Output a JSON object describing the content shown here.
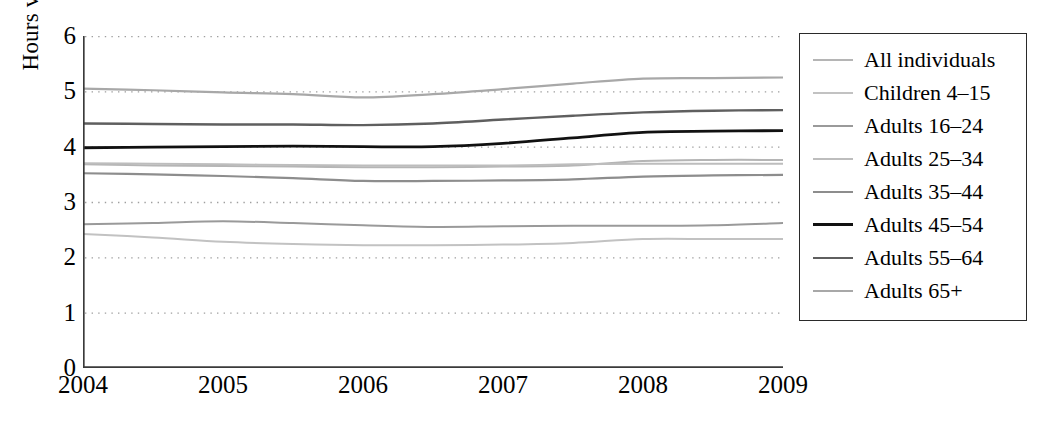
{
  "chart_data": {
    "type": "line",
    "title": "",
    "xlabel": "",
    "ylabel": "Hours viewed",
    "xlim": [
      2004,
      2009
    ],
    "ylim": [
      0,
      6
    ],
    "yticks": [
      6,
      5,
      4,
      3,
      2,
      1,
      0
    ],
    "xticks": [
      "2004",
      "2005",
      "2006",
      "2007",
      "2008",
      "2009"
    ],
    "grid": "horizontal dotted gridlines at each integer from 1 to 6",
    "legend_position": "right, outside plot, bordered box",
    "x": [
      2004,
      2004.5,
      2005,
      2005.5,
      2006,
      2006.5,
      2007,
      2007.5,
      2008,
      2008.5,
      2009
    ],
    "series": [
      {
        "name": "All individuals",
        "color": "#b5b5b5",
        "width": 2.0,
        "values": [
          3.68,
          3.66,
          3.65,
          3.64,
          3.63,
          3.63,
          3.64,
          3.66,
          3.74,
          3.76,
          3.76
        ]
      },
      {
        "name": "Children 4–15",
        "color": "#c2c2c2",
        "width": 2.0,
        "values": [
          2.42,
          2.36,
          2.28,
          2.24,
          2.22,
          2.22,
          2.23,
          2.26,
          2.33,
          2.33,
          2.33
        ]
      },
      {
        "name": "Adults 16–24",
        "color": "#9a9a9a",
        "width": 2.0,
        "values": [
          2.6,
          2.62,
          2.65,
          2.62,
          2.58,
          2.55,
          2.56,
          2.57,
          2.57,
          2.58,
          2.62
        ]
      },
      {
        "name": "Adults 25–34",
        "color": "#bdbdbd",
        "width": 2.0,
        "values": [
          3.7,
          3.69,
          3.68,
          3.67,
          3.66,
          3.66,
          3.66,
          3.68,
          3.69,
          3.69,
          3.69
        ]
      },
      {
        "name": "Adults 35–44",
        "color": "#8d8d8d",
        "width": 2.2,
        "values": [
          3.52,
          3.5,
          3.47,
          3.43,
          3.38,
          3.38,
          3.39,
          3.41,
          3.46,
          3.48,
          3.49
        ]
      },
      {
        "name": "Adults 45–54",
        "color": "#111111",
        "width": 2.8,
        "values": [
          3.98,
          3.99,
          4.0,
          4.01,
          4.0,
          4.0,
          4.06,
          4.16,
          4.26,
          4.28,
          4.29
        ]
      },
      {
        "name": "Adults 55–64",
        "color": "#5f5f5f",
        "width": 2.4,
        "values": [
          4.42,
          4.41,
          4.4,
          4.4,
          4.39,
          4.42,
          4.49,
          4.56,
          4.62,
          4.65,
          4.66
        ]
      },
      {
        "name": "Adults 65+",
        "color": "#a8a8a8",
        "width": 2.2,
        "values": [
          5.05,
          5.02,
          4.98,
          4.95,
          4.89,
          4.95,
          5.04,
          5.14,
          5.23,
          5.24,
          5.25
        ]
      }
    ]
  },
  "axis": {
    "ylabel": "Hours viewed",
    "yticks": [
      "6",
      "5",
      "4",
      "3",
      "2",
      "1",
      "0"
    ],
    "xticks": [
      "2004",
      "2005",
      "2006",
      "2007",
      "2008",
      "2009"
    ]
  },
  "legend": {
    "items": [
      {
        "label": "All individuals",
        "color": "#b5b5b5",
        "width": 2.0
      },
      {
        "label": "Children 4–15",
        "color": "#c2c2c2",
        "width": 2.0
      },
      {
        "label": "Adults 16–24",
        "color": "#9a9a9a",
        "width": 2.0
      },
      {
        "label": "Adults 25–34",
        "color": "#bdbdbd",
        "width": 2.0
      },
      {
        "label": "Adults 35–44",
        "color": "#8d8d8d",
        "width": 2.2
      },
      {
        "label": "Adults 45–54",
        "color": "#111111",
        "width": 3.0
      },
      {
        "label": "Adults 55–64",
        "color": "#5f5f5f",
        "width": 2.4
      },
      {
        "label": "Adults 65+",
        "color": "#a8a8a8",
        "width": 2.2
      }
    ]
  },
  "colors": {
    "axis": "#3a3a3a",
    "grid": "#9f9f9f",
    "legend_border": "#2a2a2a",
    "background": "#ffffff"
  }
}
